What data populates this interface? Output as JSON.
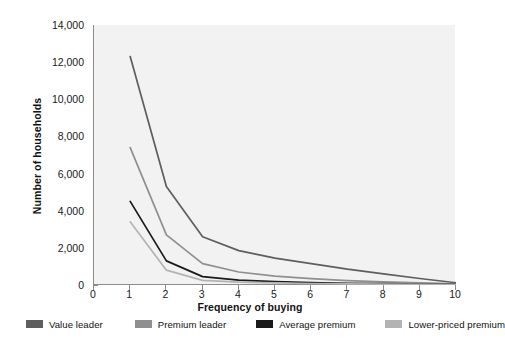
{
  "chart_data": {
    "type": "line",
    "title": "",
    "xlabel": "Frequency of buying",
    "ylabel": "Number of households",
    "x": [
      1,
      2,
      3,
      4,
      5,
      6,
      7,
      8,
      9,
      10
    ],
    "xlim": [
      0,
      10
    ],
    "ylim": [
      0,
      14000
    ],
    "xticks": [
      "0",
      "1",
      "2",
      "3",
      "4",
      "5",
      "6",
      "7",
      "8",
      "9",
      "10"
    ],
    "yticks": [
      "0",
      "2,000",
      "4,000",
      "6,000",
      "8,000",
      "10,000",
      "12,000",
      "14,000"
    ],
    "grid": false,
    "legend_position": "below",
    "series": [
      {
        "name": "Value leader",
        "color": "#5e5e5e",
        "values": [
          12300,
          5300,
          2600,
          1850,
          1450,
          1150,
          850,
          600,
          350,
          120
        ]
      },
      {
        "name": "Premium leader",
        "color": "#8f8f8f",
        "values": [
          7400,
          2700,
          1150,
          700,
          480,
          340,
          240,
          170,
          110,
          60
        ]
      },
      {
        "name": "Average premium",
        "color": "#1a1a1a",
        "values": [
          4500,
          1300,
          450,
          260,
          180,
          130,
          95,
          70,
          50,
          30
        ]
      },
      {
        "name": "Lower-priced premium",
        "color": "#b3b3b3",
        "values": [
          3400,
          800,
          250,
          150,
          110,
          80,
          60,
          45,
          30,
          20
        ]
      }
    ]
  },
  "legend": {
    "items": [
      {
        "label": "Value leader",
        "color": "#5e5e5e"
      },
      {
        "label": "Premium leader",
        "color": "#8f8f8f"
      },
      {
        "label": "Average premium",
        "color": "#1a1a1a"
      },
      {
        "label": "Lower-priced premium",
        "color": "#b3b3b3"
      }
    ]
  },
  "colors": {
    "plot_background": "#f2f2f2",
    "axis": "#8c8c8c",
    "text": "#111111",
    "page_background": "#ffffff"
  }
}
